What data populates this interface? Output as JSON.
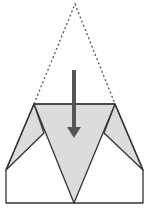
{
  "diagram": {
    "type": "origami-fold-step",
    "colors": {
      "background": "#ffffff",
      "paper_front": "#ffffff",
      "paper_folded": "#dcdcdc",
      "stroke": "#333333",
      "dashed": "#555555",
      "arrow": "#555555"
    },
    "shapes": {
      "dashed_triangle": {
        "apex": [
          75,
          4
        ],
        "left": [
          34,
          104
        ],
        "right": [
          115,
          104
        ]
      },
      "folded_band": [
        [
          34,
          104
        ],
        [
          115,
          104
        ],
        [
          143,
          170
        ],
        [
          104,
          133
        ],
        [
          74,
          203
        ],
        [
          44,
          133
        ],
        [
          6,
          170
        ]
      ],
      "center_v": [
        [
          34,
          104
        ],
        [
          115,
          104
        ],
        [
          74,
          203
        ]
      ],
      "base_rect": {
        "x": 6,
        "y": 170,
        "w": 137,
        "h": 33
      },
      "arrow": {
        "from": [
          74,
          70
        ],
        "to": [
          74,
          138
        ]
      }
    }
  }
}
